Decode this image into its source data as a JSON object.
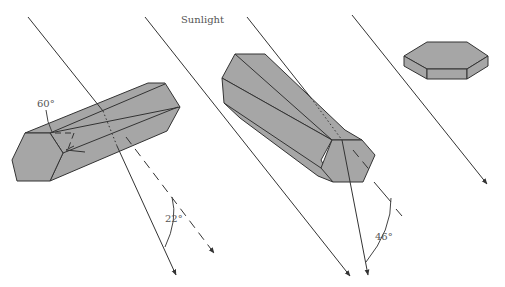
{
  "title": "Sunlight",
  "labels": {
    "sunlight": "Sunlight",
    "angle_prism": "60°",
    "angle_halo_small": "22°",
    "angle_halo_large": "46°"
  },
  "elements": {
    "crystals": [
      {
        "name": "long-column-crystal-horizontal",
        "description": "Hexagonal column lying horizontally, ray passes through side faces (60° prism)"
      },
      {
        "name": "long-column-crystal-tilted",
        "description": "Hexagonal column, ray passes from side face to end face (90° prism)"
      },
      {
        "name": "plate-crystal",
        "description": "Flat hexagonal plate crystal"
      }
    ],
    "rays": [
      {
        "name": "sunlight-ray-1",
        "deviation": "22°"
      },
      {
        "name": "sunlight-ray-2"
      },
      {
        "name": "sunlight-ray-3",
        "deviation": "46°"
      },
      {
        "name": "sunlight-ray-4"
      }
    ]
  },
  "colors": {
    "crystal_fill": "#a6a6a6",
    "line": "#333333",
    "text": "#555555",
    "background": "#ffffff"
  }
}
